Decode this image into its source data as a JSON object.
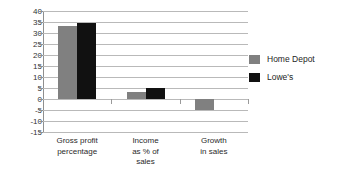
{
  "chart_data": {
    "type": "bar",
    "title": "",
    "subtitle": "",
    "xlabel": "",
    "ylabel": "",
    "categories": [
      "Gross profit\npercentage",
      "Income\nas % of\nsales",
      "Growth\nin sales"
    ],
    "category_lines": [
      [
        "Gross profit",
        "percentage"
      ],
      [
        "Income",
        "as % of",
        "sales"
      ],
      [
        "Growth",
        "in sales"
      ]
    ],
    "series": [
      {
        "name": "Home Depot",
        "color": "#808080",
        "values": [
          33,
          3,
          -5
        ]
      },
      {
        "name": "Lowe's",
        "color": "#111111",
        "values": [
          34.5,
          5,
          0
        ]
      }
    ],
    "ylim": [
      -15,
      40
    ],
    "ytick_step": 5,
    "yticks": [
      40,
      35,
      30,
      25,
      20,
      15,
      10,
      5,
      0,
      -5,
      -10,
      -15
    ],
    "ytick_labels": [
      "40",
      "35",
      "30",
      "25",
      "20",
      "15",
      "10",
      "5",
      "0",
      "-5",
      "-10",
      "-15"
    ],
    "grid": true,
    "grid_axis": "y",
    "legend_position": "right",
    "zero_line": 0,
    "background_color": "#ffffff",
    "gridline_color": "#b9b9b9",
    "axis_color": "#8f8f8f"
  },
  "legend": {
    "entries": [
      {
        "label": "Home Depot",
        "color": "#808080"
      },
      {
        "label": "Lowe's",
        "color": "#111111"
      }
    ]
  }
}
